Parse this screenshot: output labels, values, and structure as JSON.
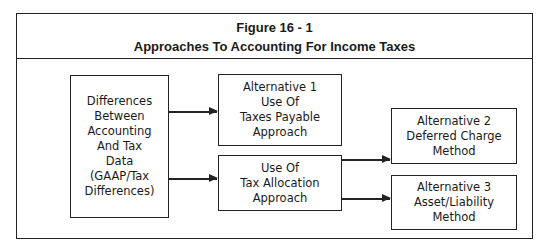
{
  "figure": {
    "number": "Figure 16 - 1",
    "title": "Approaches To Accounting For Income Taxes"
  },
  "nodes": {
    "differences": {
      "lines": [
        "Differences",
        "Between",
        "Accounting",
        "And Tax",
        "Data",
        "(GAAP/Tax",
        "Differences)"
      ]
    },
    "alternative1": {
      "lines": [
        "Alternative 1",
        "Use Of",
        "Taxes Payable",
        "Approach"
      ]
    },
    "tax_allocation": {
      "lines": [
        "Use Of",
        "Tax Allocation",
        "Approach"
      ]
    },
    "alternative2": {
      "lines": [
        "Alternative 2",
        "Deferred Charge",
        "Method"
      ]
    },
    "alternative3": {
      "lines": [
        "Alternative 3",
        "Asset/Liability",
        "Method"
      ]
    }
  },
  "edges": [
    {
      "from": "differences",
      "to": "alternative1"
    },
    {
      "from": "differences",
      "to": "tax_allocation"
    },
    {
      "from": "tax_allocation",
      "to": "alternative2"
    },
    {
      "from": "tax_allocation",
      "to": "alternative3"
    }
  ]
}
